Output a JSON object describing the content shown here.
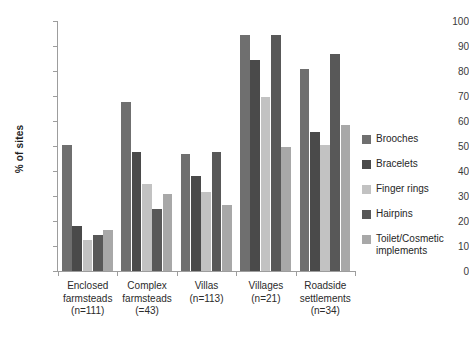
{
  "chart_data": {
    "type": "bar",
    "title": "",
    "subtitle": "",
    "xlabel": "",
    "ylabel": "% of sites",
    "ylim": [
      0,
      100
    ],
    "ytick_step": 10,
    "yticks": [
      0,
      10,
      20,
      30,
      40,
      50,
      60,
      70,
      80,
      90,
      100
    ],
    "grid": false,
    "legend_position": "right",
    "orientation": "vertical",
    "categories": [
      "Enclosed farmsteads (n=111)",
      "Complex farmsteads (=43)",
      "Villas (n=113)",
      "Villages (n=21)",
      "Roadside settlements (n=34)"
    ],
    "category_lines": [
      [
        "Enclosed",
        "farmsteads",
        "(n=111)"
      ],
      [
        "Complex",
        "farmsteads",
        "(=43)"
      ],
      [
        "Villas",
        "(n=113)"
      ],
      [
        "Villages",
        "(n=21)"
      ],
      [
        "Roadside",
        "settlements",
        "(n=34)"
      ]
    ],
    "series": [
      {
        "name": "Brooches",
        "color": "#6f6f6f",
        "values": [
          50.5,
          67.5,
          47.0,
          94.5,
          81.0
        ]
      },
      {
        "name": "Bracelets",
        "color": "#4a4a4a",
        "values": [
          18.0,
          47.5,
          38.0,
          84.5,
          55.5
        ]
      },
      {
        "name": "Finger rings",
        "color": "#c2c2c2",
        "values": [
          12.5,
          35.0,
          31.5,
          69.5,
          50.5
        ]
      },
      {
        "name": "Hairpins",
        "color": "#585858",
        "values": [
          14.5,
          25.0,
          47.5,
          94.5,
          87.0
        ]
      },
      {
        "name": "Toilet/Cosmetic implements",
        "color": "#a8a8a8",
        "values": [
          16.5,
          31.0,
          26.5,
          49.5,
          58.5
        ]
      }
    ]
  },
  "legend": {
    "items": [
      {
        "label": "Brooches"
      },
      {
        "label": "Bracelets"
      },
      {
        "label": "Finger rings"
      },
      {
        "label": "Hairpins"
      },
      {
        "label": "Toilet/Cosmetic implements"
      }
    ]
  },
  "axis": {
    "y_title": "% of sites"
  }
}
